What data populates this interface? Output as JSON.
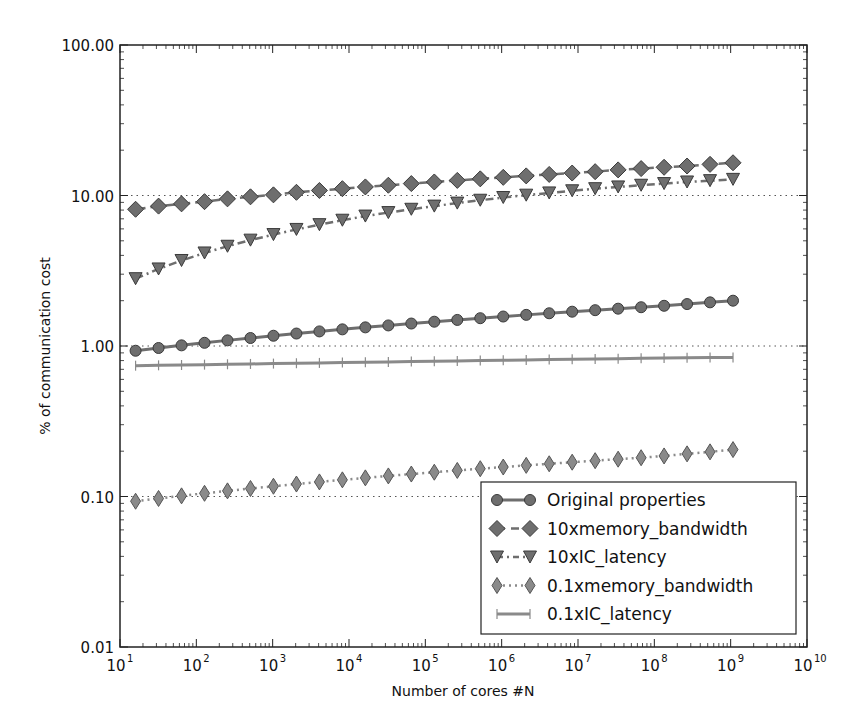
{
  "chart_data": {
    "type": "line",
    "title": "",
    "xlabel": "Number of cores #N",
    "ylabel": "% of communication cost",
    "xscale": "log",
    "yscale": "log",
    "xlim": [
      10,
      10000000000
    ],
    "ylim": [
      0.01,
      100
    ],
    "x_tick_labels": [
      "10^1",
      "10^2",
      "10^3",
      "10^4",
      "10^5",
      "10^6",
      "10^7",
      "10^8",
      "10^9",
      "10^10"
    ],
    "y_tick_labels": [
      "0.01",
      "0.10",
      "1.00",
      "10.00",
      "100.00"
    ],
    "grid": "dotted horizontal lines at 0.1, 1, 10",
    "legend_position": "lower right",
    "x": [
      16,
      32,
      64,
      128,
      256,
      512,
      1024,
      2048,
      4096,
      8192,
      16384,
      32768,
      65536,
      131072,
      262144,
      524288,
      1048576,
      2097152,
      4194304,
      8388608,
      16777216,
      33554432,
      67108864,
      134217728,
      268435456,
      536870912,
      1073741824
    ],
    "series": [
      {
        "name": "Original properties",
        "marker": "circle",
        "linestyle": "solid",
        "color": "#6e6e6e",
        "values": [
          0.93,
          0.97,
          1.01,
          1.05,
          1.09,
          1.13,
          1.17,
          1.21,
          1.25,
          1.29,
          1.33,
          1.37,
          1.41,
          1.45,
          1.49,
          1.53,
          1.57,
          1.61,
          1.65,
          1.69,
          1.73,
          1.77,
          1.81,
          1.85,
          1.9,
          1.95,
          2.0
        ]
      },
      {
        "name": "10xmemory_bandwidth",
        "marker": "diamond",
        "linestyle": "dashed",
        "color": "#6e6e6e",
        "values": [
          8.1,
          8.5,
          8.8,
          9.1,
          9.5,
          9.8,
          10.1,
          10.5,
          10.8,
          11.1,
          11.4,
          11.7,
          12.0,
          12.3,
          12.6,
          12.9,
          13.2,
          13.5,
          13.8,
          14.1,
          14.4,
          14.8,
          15.1,
          15.4,
          15.7,
          16.1,
          16.5
        ]
      },
      {
        "name": "10xIC_latency",
        "marker": "triangle-down",
        "linestyle": "dashdot",
        "color": "#6e6e6e",
        "values": [
          2.8,
          3.25,
          3.7,
          4.15,
          4.6,
          5.05,
          5.5,
          5.95,
          6.4,
          6.85,
          7.3,
          7.7,
          8.1,
          8.5,
          8.9,
          9.3,
          9.7,
          10.05,
          10.4,
          10.75,
          11.1,
          11.4,
          11.7,
          12.0,
          12.3,
          12.55,
          12.8
        ]
      },
      {
        "name": "0.1xmemory_bandwidth",
        "marker": "thin-diamond",
        "linestyle": "dotted",
        "color": "#8a8a8a",
        "values": [
          0.093,
          0.097,
          0.101,
          0.105,
          0.109,
          0.113,
          0.117,
          0.121,
          0.125,
          0.129,
          0.133,
          0.137,
          0.141,
          0.145,
          0.149,
          0.153,
          0.157,
          0.161,
          0.165,
          0.169,
          0.173,
          0.177,
          0.181,
          0.186,
          0.192,
          0.198,
          0.205
        ]
      },
      {
        "name": "0.1xIC_latency",
        "marker": "plus",
        "linestyle": "solid",
        "color": "#8a8a8a",
        "values": [
          0.74,
          0.744,
          0.748,
          0.752,
          0.756,
          0.76,
          0.764,
          0.768,
          0.772,
          0.776,
          0.78,
          0.784,
          0.788,
          0.792,
          0.796,
          0.8,
          0.804,
          0.808,
          0.812,
          0.816,
          0.82,
          0.824,
          0.828,
          0.832,
          0.835,
          0.838,
          0.84
        ]
      }
    ]
  },
  "legend": {
    "items": [
      {
        "label": "Original properties"
      },
      {
        "label": "10xmemory_bandwidth"
      },
      {
        "label": "10xIC_latency"
      },
      {
        "label": "0.1xmemory_bandwidth"
      },
      {
        "label": "0.1xIC_latency"
      }
    ]
  },
  "axes": {
    "xlabel": "Number of cores #N",
    "ylabel": "% of communication cost"
  }
}
